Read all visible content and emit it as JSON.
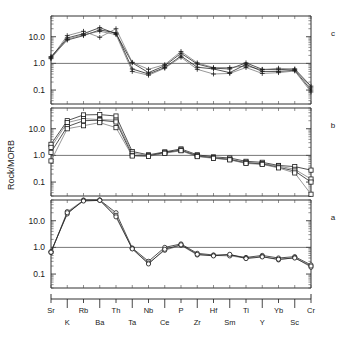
{
  "figure": {
    "type": "multi-panel-spider-diagram",
    "y_axis_title": "Rock/MORB",
    "panel_labels": [
      "c",
      "b",
      "a"
    ]
  },
  "chart_data": {
    "type": "line",
    "title": "",
    "xlabel": "",
    "ylabel": "Rock/MORB",
    "yscale": "log",
    "ylim": [
      0.03,
      60
    ],
    "ytick_labels": [
      "10.0",
      "1.0",
      "0.1"
    ],
    "ytick_values": [
      10.0,
      1.0,
      0.1
    ],
    "grid": false,
    "legend": "none",
    "reference_line": 1.0,
    "categories": [
      "Sr",
      "K",
      "Rb",
      "Ba",
      "Th",
      "Ta",
      "Nb",
      "Ce",
      "P",
      "Zr",
      "Hf",
      "Sm",
      "Ti",
      "Y",
      "Yb",
      "Sc",
      "Cr"
    ],
    "panels": [
      {
        "label": "c",
        "marker": "plus",
        "series": [
          {
            "name": "c1",
            "values": [
              1.7,
              9.0,
              13.0,
              22.0,
              13.0,
              1.05,
              0.45,
              0.82,
              2.4,
              0.95,
              0.66,
              0.62,
              1.05,
              0.6,
              0.58,
              0.62,
              0.14
            ]
          },
          {
            "name": "c2",
            "values": [
              1.6,
              11.0,
              16.0,
              9.5,
              20.0,
              1.1,
              0.6,
              0.9,
              2.8,
              1.05,
              0.7,
              0.7,
              0.8,
              0.58,
              0.66,
              0.6,
              0.12
            ]
          },
          {
            "name": "c3",
            "values": [
              1.8,
              7.5,
              11.0,
              18.0,
              14.0,
              0.62,
              0.4,
              0.7,
              1.9,
              0.72,
              0.62,
              0.45,
              0.92,
              0.5,
              0.5,
              0.55,
              0.1
            ]
          },
          {
            "name": "c4",
            "values": [
              1.5,
              8.0,
              12.0,
              16.0,
              12.0,
              0.5,
              0.36,
              0.66,
              1.7,
              0.6,
              0.4,
              0.42,
              0.7,
              0.42,
              0.45,
              0.52,
              0.085
            ]
          }
        ]
      },
      {
        "label": "b",
        "marker": "square",
        "series": [
          {
            "name": "b1",
            "values": [
              2.6,
              20.0,
              33.0,
              34.0,
              30.0,
              1.4,
              1.05,
              1.35,
              1.75,
              1.05,
              0.88,
              0.8,
              0.6,
              0.55,
              0.42,
              0.38,
              0.28
            ]
          },
          {
            "name": "b2",
            "values": [
              2.0,
              17.0,
              24.0,
              22.0,
              21.0,
              1.2,
              1.0,
              1.25,
              1.6,
              1.0,
              0.82,
              0.72,
              0.55,
              0.5,
              0.4,
              0.3,
              0.13
            ]
          },
          {
            "name": "b3",
            "values": [
              1.3,
              12.0,
              20.0,
              21.0,
              18.0,
              1.0,
              0.95,
              1.3,
              1.55,
              0.95,
              0.8,
              0.7,
              0.52,
              0.48,
              0.36,
              0.26,
              0.1
            ]
          },
          {
            "name": "b4",
            "values": [
              0.62,
              10.0,
              13.0,
              17.0,
              11.0,
              0.95,
              0.92,
              1.2,
              1.5,
              0.9,
              0.78,
              0.68,
              0.5,
              0.46,
              0.34,
              0.22,
              0.035
            ]
          }
        ]
      },
      {
        "label": "a",
        "marker": "circle",
        "series": [
          {
            "name": "a1",
            "values": [
              0.7,
              18.0,
              60.0,
              62.0,
              20.0,
              0.95,
              0.3,
              1.0,
              1.35,
              0.6,
              0.52,
              0.52,
              0.42,
              0.5,
              0.4,
              0.45,
              0.22
            ]
          },
          {
            "name": "a2",
            "values": [
              0.64,
              22.0,
              58.0,
              60.0,
              16.0,
              0.9,
              0.26,
              0.78,
              1.2,
              0.52,
              0.5,
              0.48,
              0.4,
              0.46,
              0.34,
              0.42,
              0.18
            ]
          },
          {
            "name": "a3",
            "values": [
              0.66,
              20.0,
              55.0,
              58.0,
              14.0,
              0.88,
              0.24,
              0.85,
              1.25,
              0.55,
              0.48,
              0.55,
              0.38,
              0.44,
              0.36,
              0.4,
              0.2
            ]
          }
        ]
      }
    ]
  }
}
